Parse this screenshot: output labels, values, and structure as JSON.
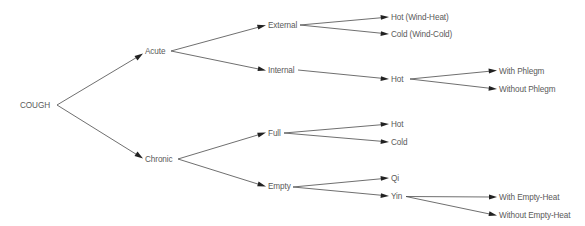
{
  "diagram": {
    "colors": {
      "text": "#5a5a5a",
      "line": "#4a4a4a",
      "arrow": "#222222",
      "background": "#ffffff"
    },
    "nodes": {
      "cough": {
        "label": "COUGH",
        "x": 20,
        "y": 108
      },
      "acute": {
        "label": "Acute",
        "x": 145,
        "y": 54
      },
      "chronic": {
        "label": "Chronic",
        "x": 145,
        "y": 162
      },
      "external": {
        "label": "External",
        "x": 268,
        "y": 28
      },
      "internal": {
        "label": "Internal",
        "x": 268,
        "y": 73
      },
      "hot_wind_heat": {
        "label": "Hot (Wind-Heat)",
        "x": 391,
        "y": 20
      },
      "cold_wind_cold": {
        "label": "Cold (Wind-Cold)",
        "x": 391,
        "y": 37
      },
      "internal_hot": {
        "label": "Hot",
        "x": 391,
        "y": 82
      },
      "with_phlegm": {
        "label": "With Phlegm",
        "x": 499,
        "y": 74
      },
      "without_phlegm": {
        "label": "Without Phlegm",
        "x": 499,
        "y": 92
      },
      "full": {
        "label": "Full",
        "x": 268,
        "y": 136
      },
      "empty": {
        "label": "Empty",
        "x": 268,
        "y": 189
      },
      "full_hot": {
        "label": "Hot",
        "x": 391,
        "y": 127
      },
      "full_cold": {
        "label": "Cold",
        "x": 391,
        "y": 145
      },
      "qi": {
        "label": "Qi",
        "x": 391,
        "y": 181
      },
      "yin": {
        "label": "Yin",
        "x": 391,
        "y": 199
      },
      "with_empty_heat": {
        "label": "With Empty-Heat",
        "x": 499,
        "y": 200
      },
      "without_empty_heat": {
        "label": "Without Empty-Heat",
        "x": 499,
        "y": 218
      }
    },
    "edges": [
      {
        "from": "cough",
        "to": "acute"
      },
      {
        "from": "cough",
        "to": "chronic"
      },
      {
        "from": "acute",
        "to": "external"
      },
      {
        "from": "acute",
        "to": "internal"
      },
      {
        "from": "external",
        "to": "hot_wind_heat"
      },
      {
        "from": "external",
        "to": "cold_wind_cold"
      },
      {
        "from": "internal",
        "to": "internal_hot"
      },
      {
        "from": "internal_hot",
        "to": "with_phlegm"
      },
      {
        "from": "internal_hot",
        "to": "without_phlegm"
      },
      {
        "from": "chronic",
        "to": "full"
      },
      {
        "from": "chronic",
        "to": "empty"
      },
      {
        "from": "full",
        "to": "full_hot"
      },
      {
        "from": "full",
        "to": "full_cold"
      },
      {
        "from": "empty",
        "to": "qi"
      },
      {
        "from": "empty",
        "to": "yin"
      },
      {
        "from": "yin",
        "to": "with_empty_heat"
      },
      {
        "from": "yin",
        "to": "without_empty_heat"
      }
    ]
  }
}
